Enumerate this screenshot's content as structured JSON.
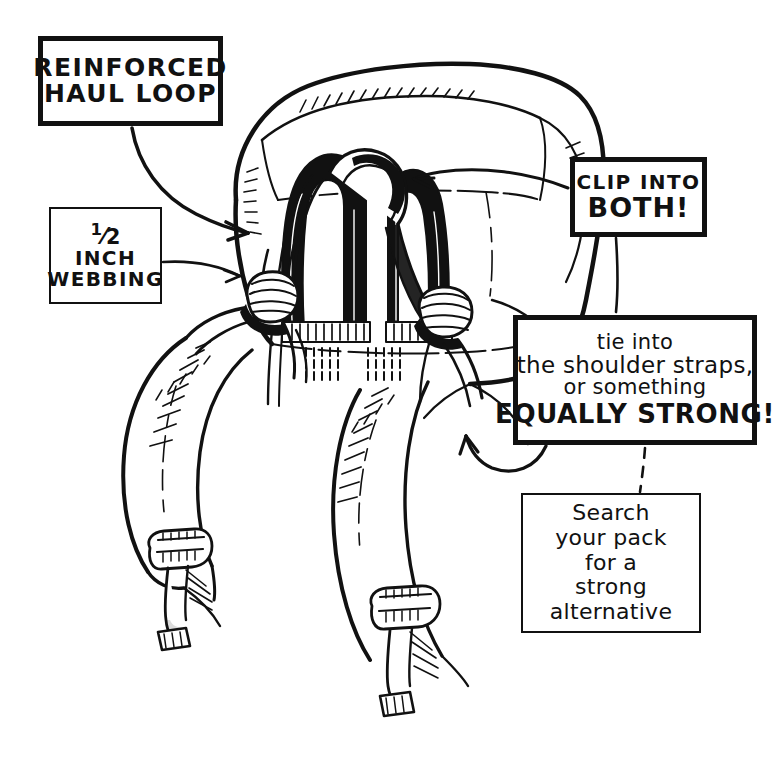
{
  "figure": {
    "background_color": "#ffffff",
    "ink_color": "#111111"
  },
  "callouts": {
    "haul_loop": {
      "lines": [
        "REINFORCED",
        "HAUL LOOP"
      ],
      "border": "thick"
    },
    "webbing": {
      "lines": [
        "1/2",
        "INCH",
        "WEBBING"
      ],
      "fraction_numerator": "1",
      "fraction_denominator": "2",
      "border": "thin"
    },
    "clip": {
      "lines": [
        "CLIP INTO",
        "BOTH!"
      ],
      "border": "thick"
    },
    "tie": {
      "lines": [
        "tie into",
        "the shoulder straps,",
        "or something",
        "EQUALLY STRONG!"
      ],
      "border": "thick"
    },
    "search": {
      "lines": [
        "Search",
        "your pack",
        "for a",
        "strong",
        "alternative"
      ],
      "border": "thin"
    }
  },
  "connectors": {
    "haul_loop_arrow": "curved arrow from REINFORCED HAUL LOOP box down-right to the haul loop",
    "webbing_arrow": "curved arrow from 1/2 INCH WEBBING box right to the webbing knot",
    "clip_arrow": "curved arrow from CLIP INTO BOTH! box left to the pack haul loops",
    "tie_arrow": "hooked arrow from tie into box curving left up to the right shoulder strap",
    "dashed_link": "dashed vertical line from EQUALLY STRONG! box down to Search your pack box"
  },
  "illustration": {
    "parts": [
      "backpack-top-lid",
      "haul-loop-left",
      "haul-loop-right",
      "webbing-strap-threaded",
      "knot-left",
      "knot-right",
      "shoulder-strap-left",
      "shoulder-strap-right",
      "ladder-lock-buckle-left",
      "ladder-lock-buckle-right",
      "stitch-marks"
    ]
  }
}
